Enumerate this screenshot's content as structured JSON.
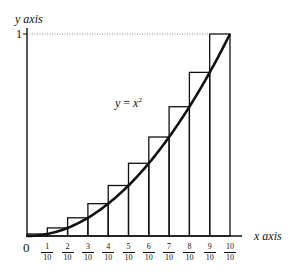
{
  "chart_data": {
    "type": "bar",
    "title": "",
    "xlabel": "x axis",
    "ylabel": "y axis",
    "curve_label": "y = x²",
    "curve": "y = x^2",
    "xlim": [
      0,
      1
    ],
    "ylim": [
      0,
      1
    ],
    "grid": false,
    "origin_label": "0",
    "y_tick_labels": [
      "1"
    ],
    "categories": [
      "1/10",
      "2/10",
      "3/10",
      "4/10",
      "5/10",
      "6/10",
      "7/10",
      "8/10",
      "9/10",
      "10/10"
    ],
    "x_ticks": [
      {
        "num": "1",
        "den": "10"
      },
      {
        "num": "2",
        "den": "10"
      },
      {
        "num": "3",
        "den": "10"
      },
      {
        "num": "4",
        "den": "10"
      },
      {
        "num": "5",
        "den": "10"
      },
      {
        "num": "6",
        "den": "10"
      },
      {
        "num": "7",
        "den": "10"
      },
      {
        "num": "8",
        "den": "10"
      },
      {
        "num": "9",
        "den": "10"
      },
      {
        "num": "10",
        "den": "10"
      }
    ],
    "values": [
      0.01,
      0.04,
      0.09,
      0.16,
      0.25,
      0.36,
      0.49,
      0.64,
      0.81,
      1.0
    ],
    "annotations": [
      "dotted reference line at y = 1",
      "first rectangle height ≈ 0.01"
    ]
  },
  "labels": {
    "y_axis": "y axis",
    "x_axis": "x axis",
    "origin": "0",
    "y_one": "1",
    "curve_lhs": "y",
    "curve_eq": " = ",
    "curve_rhs": "x",
    "curve_exp": "2"
  }
}
